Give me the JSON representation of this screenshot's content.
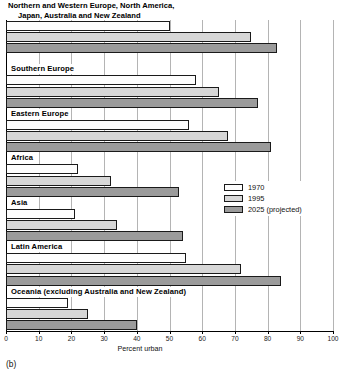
{
  "figure": {
    "caption": "(b)"
  },
  "chart_data": {
    "type": "bar",
    "orientation": "horizontal",
    "title": "",
    "xlabel": "Percent urban",
    "ylabel": "",
    "xlim": [
      0,
      100
    ],
    "xticks": [
      0,
      10,
      20,
      30,
      40,
      50,
      60,
      70,
      80,
      90,
      100
    ],
    "xticklabels": [
      "0",
      "10",
      "20",
      "30",
      "40",
      "50",
      "60",
      "70",
      "80",
      "90",
      "100"
    ],
    "grid": true,
    "grid_axis": "x",
    "legend_position": "center-right",
    "categories": [
      "Northern and Western Europe, North America, Japan, Australia and New Zealand",
      "Southern Europe",
      "Eastern Europe",
      "Africa",
      "Asia",
      "Latin America",
      "Oceania (excluding Australia and New Zealand)"
    ],
    "category_labels_display": [
      [
        "Northern and Western Europe, North America,",
        "Japan, Australia and New Zealand"
      ],
      [
        "Southern Europe"
      ],
      [
        "Eastern Europe"
      ],
      [
        "Africa"
      ],
      [
        "Asia"
      ],
      [
        "Latin America"
      ],
      [
        "Oceania (excluding Australia and New Zealand)"
      ]
    ],
    "series": [
      {
        "name": "1970",
        "color": "#fdfdfd",
        "values": [
          50,
          58,
          56,
          22,
          21,
          55,
          19
        ]
      },
      {
        "name": "1995",
        "color": "#d7d7d7",
        "values": [
          75,
          65,
          68,
          32,
          34,
          72,
          25
        ]
      },
      {
        "name": "2025 (projected)",
        "color": "#9b9b9b",
        "values": [
          83,
          77,
          81,
          53,
          54,
          84,
          40
        ]
      }
    ]
  }
}
